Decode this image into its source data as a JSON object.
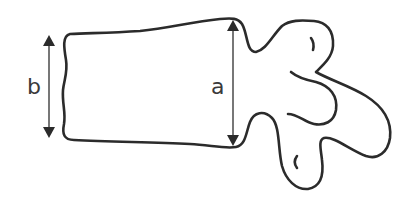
{
  "diagram": {
    "labels": {
      "a": "a",
      "b": "b"
    },
    "dimensions": [
      {
        "name": "a",
        "description": "posterior vertebral body height",
        "x": 233,
        "y_top": 20,
        "y_bottom": 146
      },
      {
        "name": "b",
        "description": "anterior vertebral body height",
        "x": 49,
        "y_top": 35,
        "y_bottom": 138
      }
    ],
    "colors": {
      "outline": "#2b2b2b",
      "dimension_line": "#555555",
      "background": "#ffffff"
    }
  }
}
